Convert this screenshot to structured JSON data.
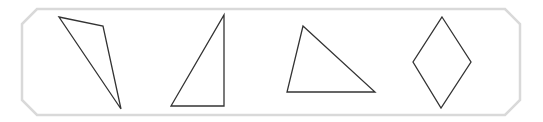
{
  "figure": {
    "width": 543,
    "height": 122,
    "background": "#ffffff",
    "frame": {
      "shape": "octagon-rectangle",
      "stroke": "#d9d9d9",
      "stroke_width": 2.5,
      "points": "37,9 505,9 520,24 520,100 505,115 37,115 22,100 22,24"
    },
    "shapes": [
      {
        "name": "obtuse-scalene-triangle",
        "type": "triangle",
        "points": "59,17 103,26 121,109"
      },
      {
        "name": "right-triangle",
        "type": "triangle",
        "points": "224,15 224,106 171,106"
      },
      {
        "name": "acute-triangle",
        "type": "triangle",
        "points": "303,26 375,92 287,92"
      },
      {
        "name": "rhombus",
        "type": "quadrilateral",
        "points": "442,17 471,62 441,108 413,62"
      }
    ],
    "shape_stroke": "#333333",
    "shape_stroke_width": 1.3
  }
}
